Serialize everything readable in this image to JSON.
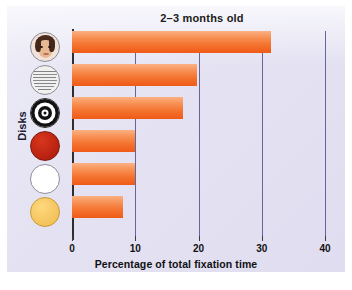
{
  "chart_data": {
    "type": "bar",
    "orientation": "horizontal",
    "title": "2–3 months old",
    "xlabel": "Percentage of total fixation time",
    "ylabel": "Disks",
    "categories": [
      "face-disk",
      "newsprint-disk",
      "bullseye-disk",
      "red-disk",
      "white-disk",
      "yellow-disk"
    ],
    "values": [
      31.5,
      19.8,
      17.5,
      10.0,
      10.0,
      8.0
    ],
    "xlim": [
      0,
      40
    ],
    "xticks": [
      0,
      10,
      20,
      30,
      40
    ],
    "xtick_labels": [
      "0",
      "10",
      "20",
      "30",
      "40"
    ],
    "grid": true,
    "legend": "none",
    "bar_color_top": "#fbb184",
    "bar_color_bottom": "#ef5a18"
  },
  "panel": {
    "background_color": "#e4e2f2",
    "gridline_color": "#4f4f8c",
    "axis_color": "#2e2e33"
  },
  "icons": [
    {
      "name": "face-disk-icon",
      "label": "face"
    },
    {
      "name": "newsprint-disk-icon",
      "label": "newsprint"
    },
    {
      "name": "bullseye-disk-icon",
      "label": "bullseye"
    },
    {
      "name": "red-disk-icon",
      "label": "red",
      "color": "#b41f10"
    },
    {
      "name": "white-disk-icon",
      "label": "white",
      "color": "#ffffff"
    },
    {
      "name": "yellow-disk-icon",
      "label": "yellow",
      "color": "#f2bf56"
    }
  ]
}
